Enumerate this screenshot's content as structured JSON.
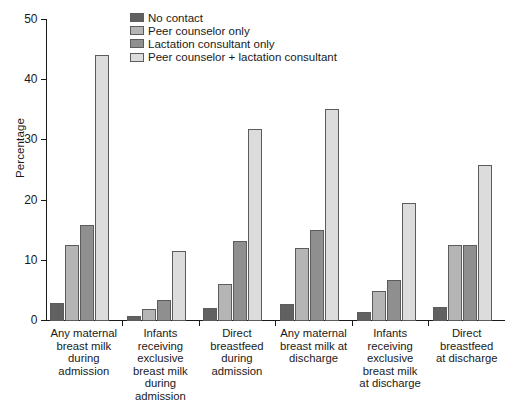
{
  "chart_data": {
    "type": "bar",
    "title": "",
    "subtitle": "",
    "xlabel": "",
    "ylabel": "Percentage",
    "ylim": [
      0,
      50
    ],
    "yticks": [
      0,
      10,
      20,
      30,
      40,
      50
    ],
    "ytick_labels": [
      "0",
      "10",
      "20",
      "30",
      "40",
      "50"
    ],
    "grid": false,
    "legend_position": "top-center",
    "categories": [
      "Any maternal breast milk during admission",
      "Infants receiving exclusive breast milk during admission",
      "Direct breastfeed during admission",
      "Any maternal breast milk at discharge",
      "Infants receiving exclusive breast milk at discharge",
      "Direct breastfeed at discharge"
    ],
    "category_lines": [
      [
        "Any maternal",
        "breast milk",
        "during",
        "admission"
      ],
      [
        "Infants",
        "receiving",
        "exclusive",
        "breast milk",
        "during",
        "admission"
      ],
      [
        "Direct",
        "breastfeed",
        "during",
        "admission"
      ],
      [
        "Any maternal",
        "breast milk at",
        "discharge"
      ],
      [
        "Infants",
        "receiving",
        "exclusive",
        "breast milk",
        "at discharge"
      ],
      [
        "Direct",
        "breastfeed",
        "at discharge"
      ]
    ],
    "series": [
      {
        "name": "No contact",
        "color": "#616161",
        "values": [
          2.8,
          0.7,
          2.0,
          2.7,
          1.3,
          2.2
        ]
      },
      {
        "name": "Peer counselor only",
        "color": "#b5b5b5",
        "values": [
          12.4,
          1.8,
          5.9,
          12.0,
          4.8,
          12.4
        ]
      },
      {
        "name": "Lactation consultant only",
        "color": "#8f8f8f",
        "values": [
          15.7,
          3.4,
          13.2,
          14.9,
          6.7,
          12.4
        ]
      },
      {
        "name": "Peer counselor + lactation consultant",
        "color": "#dcdcdc",
        "values": [
          44.0,
          11.5,
          31.8,
          35.0,
          19.5,
          25.8
        ]
      }
    ]
  },
  "legend": {
    "items": [
      "No contact",
      "Peer counselor only",
      "Lactation consultant only",
      "Peer counselor + lactation consultant"
    ]
  },
  "axis": {
    "y_title": "Percentage"
  },
  "colors": {
    "axis": "#1a1a1a",
    "bar_stroke": "#5c5c5c",
    "background": "#ffffff"
  }
}
